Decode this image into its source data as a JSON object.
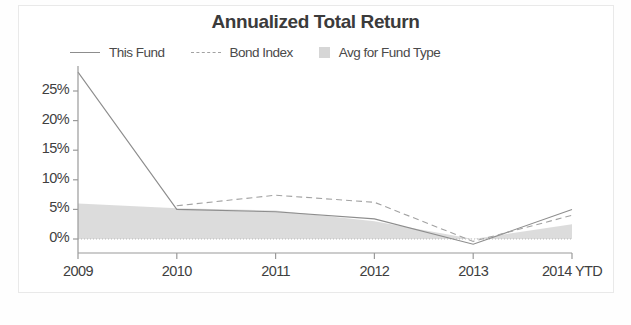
{
  "chart_data": {
    "type": "line",
    "title": "Annualized Total Return",
    "xlabel": "",
    "ylabel": "",
    "grid": false,
    "legend_position": "top",
    "categories": [
      "2009",
      "2010",
      "2011",
      "2012",
      "2013",
      "2014 YTD"
    ],
    "x_tick_labels": [
      "2009",
      "2010",
      "2011",
      "2012",
      "2013",
      "2014 YTD"
    ],
    "y_tick_labels": [
      "0%",
      "5%",
      "10%",
      "15%",
      "20%",
      "25%"
    ],
    "y_tick_values": [
      0,
      5,
      10,
      15,
      20,
      25
    ],
    "ylim": [
      -2.5,
      28.5
    ],
    "series": [
      {
        "name": "This Fund",
        "style": "solid",
        "color": "#8d8d8d",
        "values": [
          28.2,
          5.0,
          4.6,
          3.4,
          -0.9,
          5.0
        ]
      },
      {
        "name": "Bond Index",
        "style": "dashed",
        "color": "#a2a2a2",
        "values": [
          null,
          5.6,
          7.4,
          6.2,
          -0.4,
          4.0
        ]
      },
      {
        "name": "Avg for Fund Type",
        "style": "area",
        "color": "#d6d6d6",
        "values": [
          6.0,
          5.2,
          4.8,
          3.0,
          0.0,
          2.5
        ]
      }
    ]
  },
  "chart": {
    "title": "Annualized Total Return",
    "legend": [
      {
        "label": "This Fund",
        "marker": "solid-line-swatch",
        "color": "#8d8d8d"
      },
      {
        "label": "Bond Index",
        "marker": "dashed-line-swatch",
        "color": "#a2a2a2"
      },
      {
        "label": "Avg for Fund Type",
        "marker": "filled-box-swatch",
        "color": "#d6d6d6"
      }
    ],
    "axis_color": "#9a9a9a",
    "zero_line_color": "#b9b9b9"
  }
}
